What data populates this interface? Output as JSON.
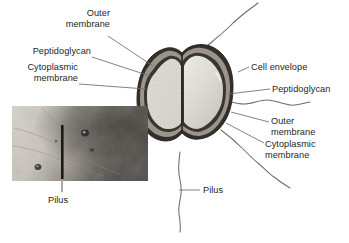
{
  "figure": {
    "kind": "bacterial-cell-cross-section-diagram",
    "background_color": "#ffffff",
    "text_color": "#231f20"
  },
  "labels": {
    "left": [
      {
        "id": "outer-membrane",
        "text": "Outer\nmembrane"
      },
      {
        "id": "peptidoglycan",
        "text": "Peptidoglycan"
      },
      {
        "id": "cytoplasmic-membrane",
        "text": "Cytoplasmic\nmembrane"
      }
    ],
    "right": [
      {
        "id": "cell-envelope",
        "text": "Cell envelope"
      },
      {
        "id": "peptidoglycan",
        "text": "Peptidoglycan"
      },
      {
        "id": "outer-membrane",
        "text": "Outer\nmembrane"
      },
      {
        "id": "cytoplasmic-membrane",
        "text": "Cytoplasmic\nmembrane"
      }
    ],
    "pilus_center": {
      "id": "pilus-center",
      "text": "Pilus"
    },
    "pilus_inset": {
      "id": "pilus-inset",
      "text": "Pilus"
    }
  },
  "cell": {
    "outer_membrane_color": "#2a2723",
    "peptidoglycan_color": "#9a948c",
    "cytoplasmic_membrane_color": "#35312c",
    "left_lobe_fill": "#d9d6cf",
    "right_lobe_fill": "#d6d4cf",
    "leader_line_color": "#6f6c68",
    "pilus_color": "#6f6c68"
  },
  "inset": {
    "id": "electron-micrograph",
    "light_field_color": "#cfcac2",
    "dark_field_color": "#4e4a46",
    "scale_bar_color": "#1b1a19"
  }
}
